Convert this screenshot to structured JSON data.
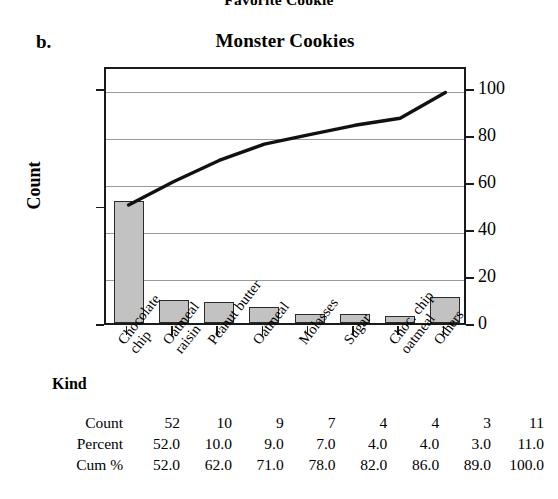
{
  "clipped_header": "Favorite Cookie",
  "panel_label": "b.",
  "chart_title": "Monster Cookies",
  "axis": {
    "left_title": "Count",
    "left_ticks": [
      "0",
      "50",
      "100"
    ],
    "right_ticks": [
      "0",
      "20",
      "40",
      "60",
      "80",
      "100"
    ],
    "x_title": "Kind"
  },
  "table": {
    "rows": [
      {
        "label": "Count",
        "values": [
          "52",
          "10",
          "9",
          "7",
          "4",
          "4",
          "3",
          "11"
        ]
      },
      {
        "label": "Percent",
        "values": [
          "52.0",
          "10.0",
          "9.0",
          "7.0",
          "4.0",
          "4.0",
          "3.0",
          "11.0"
        ]
      },
      {
        "label": "Cum %",
        "values": [
          "52.0",
          "62.0",
          "71.0",
          "78.0",
          "82.0",
          "86.0",
          "89.0",
          "100.0"
        ]
      }
    ]
  },
  "colors": {
    "bar_fill": "#c2c2c2",
    "bar_edge": "#2b2b2b",
    "line": "#111111",
    "grid": "#9a9a9a",
    "frame": "#1a1a1a"
  },
  "chart_data": {
    "type": "bar",
    "title": "Monster Cookies",
    "xlabel": "Kind",
    "ylabel": "Count",
    "y2label": "Percent",
    "ylim": [
      0,
      110
    ],
    "y2lim": [
      0,
      110
    ],
    "yticks": [
      0,
      50,
      100
    ],
    "y2ticks": [
      0,
      20,
      40,
      60,
      80,
      100
    ],
    "grid": true,
    "legend": "none",
    "categories": [
      "Chocolate chip",
      "Oatmeal raisin",
      "Peanut butter",
      "Oatmeal",
      "Molasses",
      "Sugar",
      "Choc. chip oatmeal",
      "Others"
    ],
    "category_lines": [
      [
        "Chocolate",
        "chip"
      ],
      [
        "Oatmeal",
        "raisin"
      ],
      [
        "Peanut butter"
      ],
      [
        "Oatmeal"
      ],
      [
        "Molasses"
      ],
      [
        "Sugar"
      ],
      [
        "Choc. chip",
        "oatmeal"
      ],
      [
        "Others"
      ]
    ],
    "series": [
      {
        "name": "Count",
        "type": "bar",
        "values": [
          52,
          10,
          9,
          7,
          4,
          4,
          3,
          11
        ]
      },
      {
        "name": "Percent",
        "type": "bar",
        "values": [
          52.0,
          10.0,
          9.0,
          7.0,
          4.0,
          4.0,
          3.0,
          11.0
        ]
      },
      {
        "name": "Cum %",
        "type": "line",
        "values": [
          52.0,
          62.0,
          71.0,
          78.0,
          82.0,
          86.0,
          89.0,
          100.0
        ]
      }
    ]
  }
}
